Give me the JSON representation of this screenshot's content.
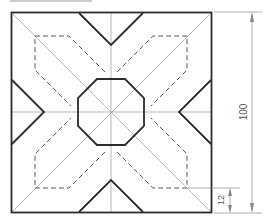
{
  "drawing": {
    "title": "Square plate with octagonal center and chevron cut-outs",
    "colors": {
      "outline": "#2b2b2b",
      "hidden": "#555555",
      "thin": "#9a9a9a",
      "dimension": "#888888"
    },
    "dimensions": {
      "overall_height": "100",
      "offset": "12"
    }
  }
}
